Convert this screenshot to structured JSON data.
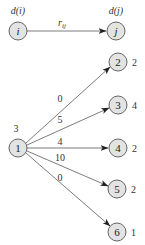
{
  "legend": {
    "source_node": {
      "label": "i",
      "attr": "d(i)",
      "x": 18,
      "y": 31
    },
    "target_node": {
      "label": "j",
      "attr": "d(j)",
      "x": 116,
      "y": 31
    },
    "edge_label_main": "r",
    "edge_label_sub": "ij"
  },
  "graph": {
    "center": {
      "label": "1",
      "value": "3",
      "x": 18,
      "y": 148
    },
    "nodes": [
      {
        "label": "2",
        "value": "2",
        "x": 118,
        "y": 62,
        "edge": "0",
        "ex": 60,
        "ey": 99
      },
      {
        "label": "3",
        "value": "4",
        "x": 118,
        "y": 105,
        "edge": "5",
        "ex": 60,
        "ey": 120
      },
      {
        "label": "4",
        "value": "2",
        "x": 118,
        "y": 148,
        "edge": "4",
        "ex": 60,
        "ey": 142
      },
      {
        "label": "5",
        "value": "2",
        "x": 117,
        "y": 189,
        "edge": "10",
        "ex": 58,
        "ey": 158
      },
      {
        "label": "6",
        "value": "1",
        "x": 117,
        "y": 232,
        "edge": "0",
        "ex": 60,
        "ey": 177
      }
    ]
  },
  "colors": {
    "node_fill": "#e3e3e3",
    "node_stroke": "#555555",
    "edge": "#444444"
  }
}
